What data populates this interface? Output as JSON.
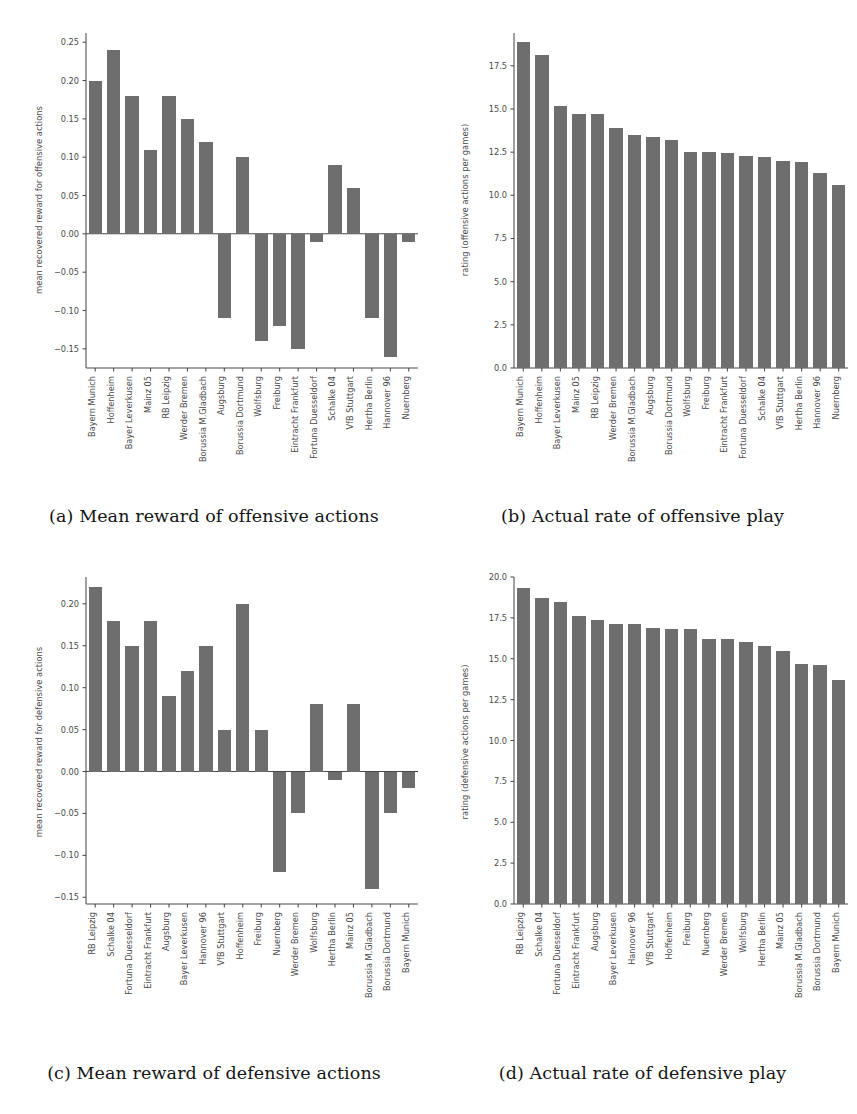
{
  "style": {
    "bar_color": "#6e6e6e",
    "axis_color": "#4a4a4a",
    "text_color": "#4a4a4a",
    "background": "#ffffff"
  },
  "figure": {
    "panels": [
      {
        "key": "a",
        "caption": "(a) Mean reward of offensive actions"
      },
      {
        "key": "b",
        "caption": "(b) Actual rate of offensive play"
      },
      {
        "key": "c",
        "caption": "(c) Mean reward of defensive actions"
      },
      {
        "key": "d",
        "caption": "(d) Actual rate of defensive play"
      }
    ]
  },
  "chart_data": [
    {
      "id": "a",
      "type": "bar",
      "title": "(a) Mean reward of offensive actions",
      "xlabel": "",
      "ylabel": "mean recovered reward for offensive actions",
      "ylim": [
        -0.175,
        0.262
      ],
      "yticks": [
        0.25,
        0.2,
        0.15,
        0.1,
        0.05,
        0.0,
        -0.05,
        -0.1,
        -0.15
      ],
      "ytick_labels": [
        "0.25",
        "0.20",
        "0.15",
        "0.10",
        "0.05",
        "0.00",
        "−0.05",
        "−0.10",
        "−0.15"
      ],
      "grid": false,
      "legend": null,
      "categories": [
        "Bayern Munich",
        "Hoffenheim",
        "Bayer Leverkusen",
        "Mainz 05",
        "RB Leipzig",
        "Werder Bremen",
        "Borussia M.Gladbach",
        "Augsburg",
        "Borussia Dortmund",
        "Wolfsburg",
        "Freiburg",
        "Eintracht Frankfurt",
        "Fortuna Duesseldorf",
        "Schalke 04",
        "VfB Stuttgart",
        "Hertha Berlin",
        "Hannover 96",
        "Nuernberg"
      ],
      "values": [
        0.2,
        0.24,
        0.18,
        0.11,
        0.18,
        0.15,
        0.12,
        -0.11,
        0.1,
        -0.14,
        -0.12,
        -0.15,
        -0.01,
        0.09,
        0.06,
        -0.11,
        -0.16,
        -0.01
      ]
    },
    {
      "id": "b",
      "type": "bar",
      "title": "(b) Actual rate of offensive play",
      "xlabel": "",
      "ylabel": "rating (offensive actions per games)",
      "ylim": [
        0,
        19.4
      ],
      "yticks": [
        17.5,
        15.0,
        12.5,
        10.0,
        7.5,
        5.0,
        2.5,
        0.0
      ],
      "ytick_labels": [
        "17.5",
        "15.0",
        "12.5",
        "10.0",
        "7.5",
        "5.0",
        "2.5",
        "0.0"
      ],
      "grid": false,
      "legend": null,
      "categories": [
        "Bayern Munich",
        "Hoffenheim",
        "Bayer Leverkusen",
        "Mainz 05",
        "RB Leipzig",
        "Werder Bremen",
        "Borussia M.Gladbach",
        "Augsburg",
        "Borussia Dortmund",
        "Wolfsburg",
        "Freiburg",
        "Eintracht Frankfurt",
        "Fortuna Duesseldorf",
        "Schalke 04",
        "VfB Stuttgart",
        "Hertha Berlin",
        "Hannover 96",
        "Nuernberg"
      ],
      "values": [
        18.9,
        18.1,
        15.2,
        14.7,
        14.7,
        13.9,
        13.5,
        13.4,
        13.2,
        12.5,
        12.5,
        12.45,
        12.3,
        12.2,
        12.0,
        11.95,
        11.3,
        10.6
      ]
    },
    {
      "id": "c",
      "type": "bar",
      "title": "(c) Mean reward of defensive actions",
      "xlabel": "",
      "ylabel": "mean recovered reward for defensive actions",
      "ylim": [
        -0.158,
        0.232
      ],
      "yticks": [
        0.2,
        0.15,
        0.1,
        0.05,
        0.0,
        -0.05,
        -0.1,
        -0.15
      ],
      "ytick_labels": [
        "0.20",
        "0.15",
        "0.10",
        "0.05",
        "0.00",
        "−0.05",
        "−0.10",
        "−0.15"
      ],
      "grid": false,
      "legend": null,
      "categories": [
        "RB Leipzig",
        "Schalke 04",
        "Fortuna Duesseldorf",
        "Eintracht Frankfurt",
        "Augsburg",
        "Bayer Leverkusen",
        "Hannover 96",
        "VfB Stuttgart",
        "Hoffenheim",
        "Freiburg",
        "Nuernberg",
        "Werder Bremen",
        "Wolfsburg",
        "Hertha Berlin",
        "Mainz 05",
        "Borussia M.Gladbach",
        "Borussia Dortmund",
        "Bayern Munich"
      ],
      "values": [
        0.22,
        0.18,
        0.15,
        0.18,
        0.09,
        0.12,
        0.15,
        0.05,
        0.2,
        0.05,
        -0.12,
        -0.05,
        0.08,
        -0.01,
        0.08,
        -0.14,
        -0.05,
        -0.02
      ]
    },
    {
      "id": "d",
      "type": "bar",
      "title": "(d) Actual rate of defensive play",
      "xlabel": "",
      "ylabel": "rating (defensive actions per games)",
      "ylim": [
        0,
        20.0
      ],
      "yticks": [
        20.0,
        17.5,
        15.0,
        12.5,
        10.0,
        7.5,
        5.0,
        2.5,
        0.0
      ],
      "ytick_labels": [
        "20.0",
        "17.5",
        "15.0",
        "12.5",
        "10.0",
        "7.5",
        "5.0",
        "2.5",
        "0.0"
      ],
      "grid": false,
      "legend": null,
      "categories": [
        "RB Leipzig",
        "Schalke 04",
        "Fortuna Duesseldorf",
        "Eintracht Frankfurt",
        "Augsburg",
        "Bayer Leverkusen",
        "Hannover 96",
        "VfB Stuttgart",
        "Hoffenheim",
        "Freiburg",
        "Nuernberg",
        "Werder Bremen",
        "Wolfsburg",
        "Hertha Berlin",
        "Mainz 05",
        "Borussia M.Gladbach",
        "Borussia Dortmund",
        "Bayern Munich"
      ],
      "values": [
        19.3,
        18.7,
        18.5,
        17.6,
        17.4,
        17.1,
        17.1,
        16.9,
        16.8,
        16.8,
        16.2,
        16.2,
        16.0,
        15.8,
        15.5,
        14.7,
        14.6,
        13.7
      ]
    }
  ]
}
